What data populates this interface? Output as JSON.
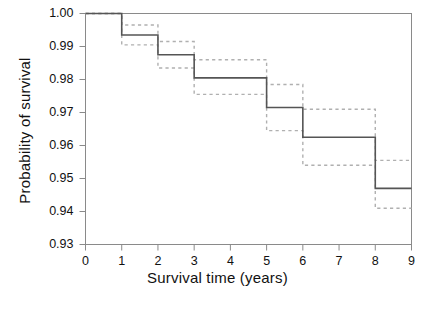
{
  "figure": {
    "background": "#ffffff",
    "line_color": "#555555",
    "ci_color": "#b0b0b0",
    "axis_color": "#8a8a8a"
  },
  "axes": {
    "x_title": "Survival time (years)",
    "y_title": "Probability of survival",
    "x_ticks": [
      "0",
      "1",
      "2",
      "3",
      "4",
      "5",
      "6",
      "7",
      "8",
      "9"
    ],
    "y_ticks": [
      "1.00",
      "0.99",
      "0.98",
      "0.97",
      "0.96",
      "0.95",
      "0.94",
      "0.93"
    ]
  },
  "chart_data": {
    "type": "line",
    "subtype": "kaplan-meier-step",
    "title": "",
    "xlabel": "Survival time (years)",
    "ylabel": "Probability of survival",
    "xlim": [
      0,
      9
    ],
    "ylim": [
      0.93,
      1.0
    ],
    "x_ticks": [
      0,
      1,
      2,
      3,
      4,
      5,
      6,
      7,
      8,
      9
    ],
    "y_ticks": [
      0.93,
      0.94,
      0.95,
      0.96,
      0.97,
      0.98,
      0.99,
      1.0
    ],
    "grid": false,
    "legend": "none",
    "step_x": [
      0,
      1,
      2,
      3,
      4,
      5,
      6,
      7,
      8,
      9
    ],
    "series": [
      {
        "name": "Survival estimate",
        "style": "solid",
        "values": [
          1.0,
          0.9935,
          0.9875,
          0.9805,
          0.9805,
          0.9715,
          0.9625,
          0.9625,
          0.947,
          0.947
        ]
      },
      {
        "name": "Upper 95% confidence limit",
        "style": "dotted",
        "values": [
          1.0,
          0.9965,
          0.9915,
          0.986,
          0.986,
          0.9785,
          0.971,
          0.971,
          0.9555,
          0.9555
        ]
      },
      {
        "name": "Lower 95% confidence limit",
        "style": "dotted",
        "values": [
          1.0,
          0.9905,
          0.9835,
          0.9755,
          0.9755,
          0.9645,
          0.954,
          0.954,
          0.941,
          0.941
        ]
      }
    ]
  }
}
